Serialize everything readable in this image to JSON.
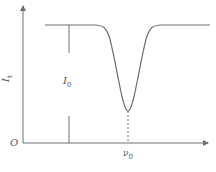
{
  "diagram": {
    "type": "absorption-dip-curve",
    "colors": {
      "stroke": "#6e6e6e",
      "text": "#555555",
      "background": "#ffffff"
    },
    "axes": {
      "origin_label": "O",
      "y_label": {
        "base": "I",
        "sub": "t"
      },
      "x_arrow": true,
      "y_arrow": true
    },
    "annotations": {
      "intensity_label": {
        "base": "I",
        "sub": "0"
      },
      "frequency_label": {
        "base": "ν",
        "sub": "0"
      }
    },
    "curve": {
      "description": "Flat transmitted intensity with a single bell-shaped dip centered at ν0",
      "baseline_level": "high",
      "dip_center": "ν0"
    }
  }
}
